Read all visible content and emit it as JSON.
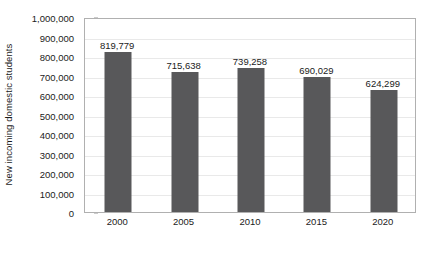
{
  "chart_data": {
    "type": "bar",
    "title": "",
    "xlabel": "",
    "ylabel": "New incoming domestic students",
    "categories": [
      "2000",
      "2005",
      "2010",
      "2015",
      "2020"
    ],
    "values": [
      819779,
      715638,
      739258,
      690029,
      624299
    ],
    "value_labels": [
      "819,779",
      "715,638",
      "739,258",
      "690,029",
      "624,299"
    ],
    "ylim": [
      0,
      1000000
    ],
    "y_ticks": [
      0,
      100000,
      200000,
      300000,
      400000,
      500000,
      600000,
      700000,
      800000,
      900000,
      1000000
    ],
    "y_tick_labels": [
      "0",
      "100,000",
      "200,000",
      "300,000",
      "400,000",
      "500,000",
      "600,000",
      "700,000",
      "800,000",
      "900,000",
      "1,000,000"
    ],
    "grid": true,
    "legend": false,
    "legend_position": "none",
    "bar_color": "#58585a",
    "gridline_color": "#e9e9e9",
    "axis_color": "#b0b0b0",
    "text_color": "#1b1b1b",
    "background_color": "#ffffff"
  }
}
